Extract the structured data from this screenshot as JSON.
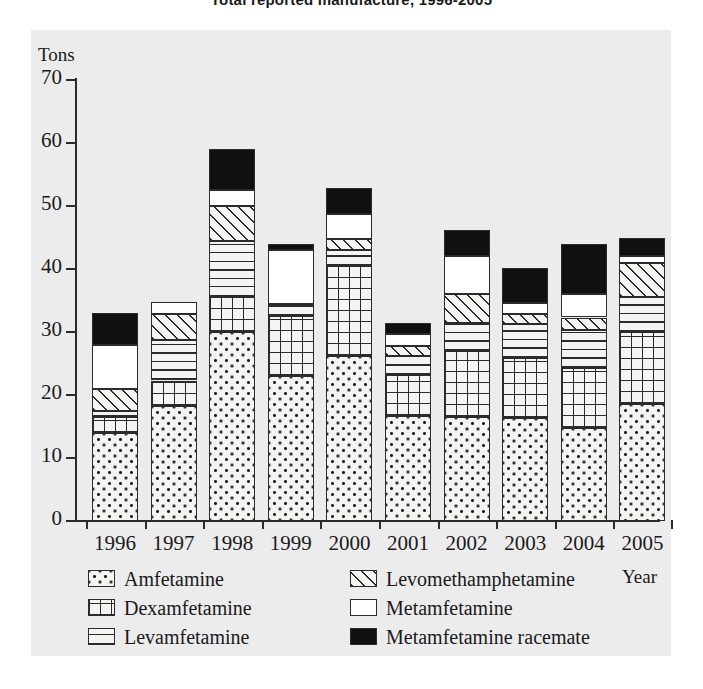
{
  "chart_data": {
    "type": "bar",
    "subtype": "stacked-bar",
    "title": "Total reported manufacture, 1996-2005",
    "xlabel": "Year",
    "ylabel": "Tons",
    "ylim": [
      0,
      70
    ],
    "yticks": [
      0,
      10,
      20,
      30,
      40,
      50,
      60,
      70
    ],
    "grid": false,
    "legend_position": "bottom",
    "categories": [
      "1996",
      "1997",
      "1998",
      "1999",
      "2000",
      "2001",
      "2002",
      "2003",
      "2004",
      "2005"
    ],
    "series": [
      {
        "name": "Amfetamine",
        "pattern": "dotted",
        "values": [
          14.0,
          18.3,
          30.0,
          23.0,
          26.2,
          16.7,
          16.5,
          16.3,
          14.8,
          18.5
        ]
      },
      {
        "name": "Dexamfetamine",
        "pattern": "grid",
        "values": [
          2.5,
          4.0,
          5.5,
          9.5,
          14.3,
          6.5,
          10.5,
          9.5,
          9.5,
          11.5
        ]
      },
      {
        "name": "Levamfetamine",
        "pattern": "horizontal-lines",
        "values": [
          1.0,
          6.5,
          9.0,
          2.0,
          2.5,
          3.0,
          4.5,
          5.5,
          6.0,
          5.5
        ]
      },
      {
        "name": "Levomethamphetamine",
        "pattern": "diagonal-hatch",
        "values": [
          3.5,
          4.0,
          5.5,
          0.0,
          1.8,
          1.5,
          4.5,
          1.5,
          2.0,
          5.5
        ]
      },
      {
        "name": "Metamfetamine",
        "pattern": "white",
        "values": [
          7.0,
          2.0,
          2.5,
          8.5,
          4.0,
          2.0,
          6.0,
          1.8,
          3.7,
          1.0
        ]
      },
      {
        "name": "Metamfetamine racemate",
        "pattern": "black",
        "values": [
          5.0,
          0.0,
          6.5,
          1.0,
          4.0,
          1.7,
          4.2,
          5.5,
          8.0,
          3.0
        ]
      }
    ],
    "totals": [
      33.0,
      34.8,
      59.0,
      44.0,
      52.8,
      31.4,
      46.2,
      40.0,
      44.0,
      45.0
    ]
  },
  "legend": {
    "entries": [
      {
        "label": "Amfetamine",
        "key": "amfetamine"
      },
      {
        "label": "Dexamfetamine",
        "key": "dexamfetamine"
      },
      {
        "label": "Levamfetamine",
        "key": "levamfetamine"
      },
      {
        "label": "Levomethamphetamine",
        "key": "levomethamphetamine"
      },
      {
        "label": "Metamfetamine",
        "key": "metamfetamine"
      },
      {
        "label": "Metamfetamine racemate",
        "key": "racemate"
      }
    ]
  },
  "colors": {
    "ink": "#1a1a1a",
    "axis": "#2b2b2b",
    "panel": "#ececed",
    "fill_light": "#f4f4f2",
    "fill_black": "#101010",
    "fill_white": "#ffffff"
  }
}
